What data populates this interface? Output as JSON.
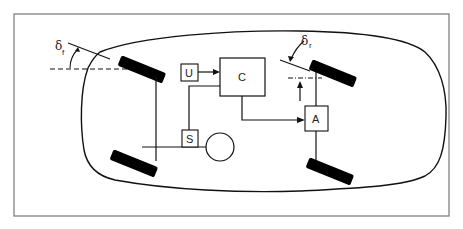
{
  "diagram": {
    "type": "block-schematic",
    "blocks": [
      {
        "id": "U",
        "label": "U"
      },
      {
        "id": "C",
        "label": "C"
      },
      {
        "id": "S",
        "label": "S"
      },
      {
        "id": "A",
        "label": "A"
      }
    ],
    "angles": {
      "front": {
        "symbol": "δ",
        "subscript": "f"
      },
      "rear": {
        "symbol": "δ",
        "subscript": "r"
      }
    },
    "connections": [
      {
        "from": "U",
        "to": "C",
        "arrow": true
      },
      {
        "from": "S",
        "to": "C",
        "arrow": false
      },
      {
        "from": "C",
        "to": "A",
        "arrow": true
      },
      {
        "from": "A",
        "to": "rear-axle",
        "arrow": false
      },
      {
        "from": "front-axle",
        "to": "S",
        "arrow": false
      }
    ],
    "colors": {
      "line": "#111111",
      "frame": "#777777",
      "tire": "#000000",
      "background": "#ffffff"
    }
  }
}
